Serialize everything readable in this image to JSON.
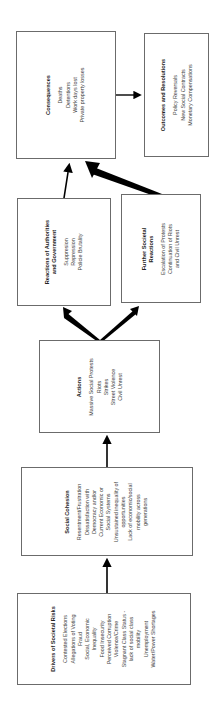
{
  "diagram": {
    "boxes": {
      "consequences": {
        "title": "Consequences",
        "items": [
          "Deaths",
          "Detentions",
          "Work days lost",
          "Private property losses"
        ]
      },
      "outcomes": {
        "title": "Outcomes and Resolutions",
        "items": [
          "Policy Reversals",
          "New Social Contracts",
          "Monetary Compensations"
        ]
      },
      "reactions": {
        "title_line1": "Reactions of Authorities",
        "title_line2": "and Government",
        "items": [
          "Suppresion",
          "Repression",
          "Policie Brutality"
        ]
      },
      "further": {
        "title_line1": "Further Societal",
        "title_line2": "Reactions",
        "items": [
          "Escalation of Protests",
          "Continuation of Riots",
          "and Civil Unrest"
        ]
      },
      "actions": {
        "title": "Actions",
        "items": [
          "Massive Social Protests",
          "Riots",
          "Strikes",
          "Street Violence",
          "Civil Unrest"
        ]
      },
      "cohesion": {
        "title": "Social Cohesion",
        "items": [
          "Resentment/Frustration",
          "Dissatisfaction with",
          "Democracy and/or",
          "Current Economic or",
          "Social Systems",
          "Unsustained inequality of",
          "opportunities",
          "Lack of economic/social",
          "mobility across",
          "generations"
        ]
      },
      "drivers": {
        "title": "Drivers of Societal Risks",
        "items": [
          "Contested Elections",
          "Allegations of Voting",
          "Fraud",
          "Social, Economic",
          "Inequality",
          "Food Insecurity",
          "Perceived Corruption",
          "Violence/Crime",
          "Stagnant Class Status -",
          "lack of social class",
          "mobility",
          "Unemployment",
          "Water/Power Shortages"
        ]
      }
    },
    "colors": {
      "border": "#6b6b6b",
      "arrow": "#000000",
      "text": "#333333"
    }
  }
}
